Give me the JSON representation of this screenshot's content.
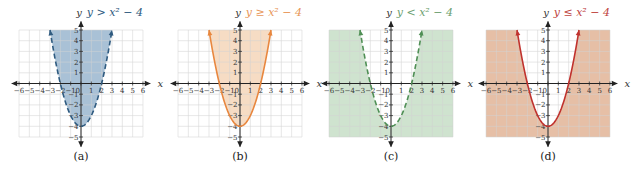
{
  "figure": {
    "panels": [
      {
        "id": "a",
        "caption": "(a)",
        "equation": "y > x² − 4",
        "operator": ">",
        "boundary": "dashed",
        "shade": "inside",
        "fill_color": "#a9c1d6",
        "curve_color": "#2f5b80",
        "label_color": "#2f5b80",
        "origin_x": 81
      },
      {
        "id": "b",
        "caption": "(b)",
        "equation": "y ≥ x² − 4",
        "operator": "≥",
        "boundary": "solid",
        "shade": "inside",
        "fill_color": "#f6dcc4",
        "curve_color": "#e8873f",
        "label_color": "#e8975a",
        "origin_x": 240
      },
      {
        "id": "c",
        "caption": "(c)",
        "equation": "y < x² − 4",
        "operator": "<",
        "boundary": "dashed",
        "shade": "outside",
        "fill_color": "#cfe3cf",
        "curve_color": "#4f8f55",
        "label_color": "#6e9f72",
        "origin_x": 391
      },
      {
        "id": "d",
        "caption": "(d)",
        "equation": "y ≤ x² − 4",
        "operator": "≤",
        "boundary": "solid",
        "shade": "outside",
        "fill_color": "#e6bfa6",
        "curve_color": "#c0322e",
        "label_color": "#c0453f",
        "origin_x": 548
      }
    ],
    "axes": {
      "x_label": "x",
      "y_label": "y",
      "x_ticks": [
        -6,
        -5,
        -4,
        -3,
        -2,
        -1,
        0,
        1,
        2,
        3,
        4,
        5,
        6
      ],
      "y_ticks": [
        -5,
        -4,
        -3,
        -2,
        -1,
        1,
        2,
        3,
        4,
        5
      ],
      "origin_label": "0"
    }
  },
  "chart_data": [
    {
      "type": "area",
      "title": "y > x² − 4",
      "panel_caption": "(a)",
      "function": "x^2 - 4",
      "boundary_style": "dashed",
      "shaded_region": "above curve (inside parabola)",
      "x": [
        -3,
        -2,
        -1,
        0,
        1,
        2,
        3
      ],
      "y": [
        5,
        0,
        -3,
        -4,
        -3,
        0,
        5
      ],
      "vertex": [
        0,
        -4
      ],
      "x_intercepts": [
        -2,
        2
      ],
      "xlabel": "x",
      "ylabel": "y",
      "xlim": [
        -6,
        6
      ],
      "ylim": [
        -5,
        5
      ],
      "grid": true
    },
    {
      "type": "area",
      "title": "y ≥ x² − 4",
      "panel_caption": "(b)",
      "function": "x^2 - 4",
      "boundary_style": "solid",
      "shaded_region": "above curve (inside parabola)",
      "x": [
        -3,
        -2,
        -1,
        0,
        1,
        2,
        3
      ],
      "y": [
        5,
        0,
        -3,
        -4,
        -3,
        0,
        5
      ],
      "vertex": [
        0,
        -4
      ],
      "x_intercepts": [
        -2,
        2
      ],
      "xlabel": "x",
      "ylabel": "y",
      "xlim": [
        -6,
        6
      ],
      "ylim": [
        -5,
        5
      ],
      "grid": true
    },
    {
      "type": "area",
      "title": "y < x² − 4",
      "panel_caption": "(c)",
      "function": "x^2 - 4",
      "boundary_style": "dashed",
      "shaded_region": "below curve (outside parabola)",
      "x": [
        -3,
        -2,
        -1,
        0,
        1,
        2,
        3
      ],
      "y": [
        5,
        0,
        -3,
        -4,
        -3,
        0,
        5
      ],
      "vertex": [
        0,
        -4
      ],
      "x_intercepts": [
        -2,
        2
      ],
      "xlabel": "x",
      "ylabel": "y",
      "xlim": [
        -6,
        6
      ],
      "ylim": [
        -5,
        5
      ],
      "grid": true
    },
    {
      "type": "area",
      "title": "y ≤ x² − 4",
      "panel_caption": "(d)",
      "function": "x^2 - 4",
      "boundary_style": "solid",
      "shaded_region": "below curve (outside parabola)",
      "x": [
        -3,
        -2,
        -1,
        0,
        1,
        2,
        3
      ],
      "y": [
        5,
        0,
        -3,
        -4,
        -3,
        0,
        5
      ],
      "vertex": [
        0,
        -4
      ],
      "x_intercepts": [
        -2,
        2
      ],
      "xlabel": "x",
      "ylabel": "y",
      "xlim": [
        -6,
        6
      ],
      "ylim": [
        -5,
        5
      ],
      "grid": true
    }
  ]
}
